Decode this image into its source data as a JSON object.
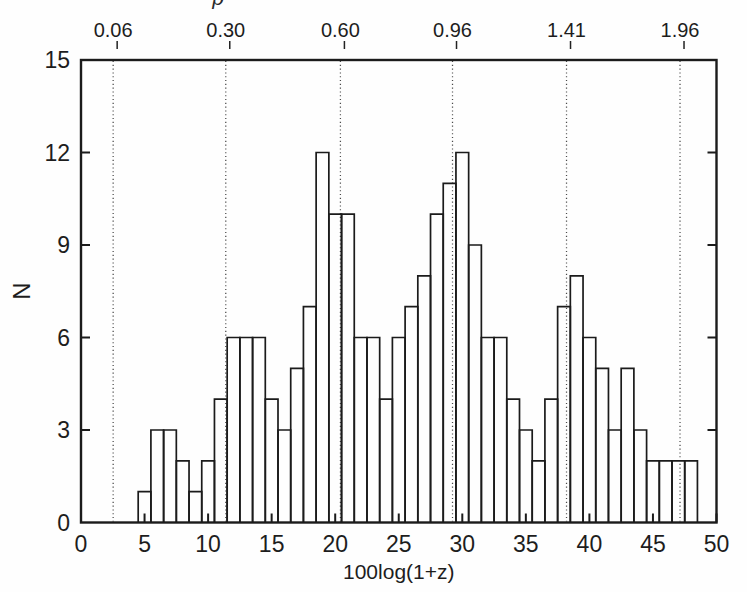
{
  "page": {
    "header_fragment": "p"
  },
  "chart_data": {
    "type": "bar",
    "subtype": "histogram",
    "title": "",
    "xlabel": "100log(1+z)",
    "ylabel": "N",
    "xlim": [
      0,
      50
    ],
    "ylim": [
      0,
      15
    ],
    "x_ticks": [
      0,
      5,
      10,
      15,
      20,
      25,
      30,
      35,
      40,
      45,
      50
    ],
    "y_ticks": [
      0,
      3,
      6,
      9,
      12,
      15
    ],
    "grid": "vertical-dotted-at-top-axis-ticks",
    "legend": "none",
    "bar_fill": "none",
    "line_color": "#1b1b1b",
    "top_axis": {
      "labels": [
        "0.06",
        "0.30",
        "0.60",
        "0.96",
        "1.41",
        "1.96"
      ],
      "positions_x": [
        2.53,
        11.39,
        20.41,
        29.23,
        38.2,
        47.13
      ]
    },
    "bins": {
      "start": 4.5,
      "width": 1,
      "centers": [
        5,
        6,
        7,
        8,
        9,
        10,
        11,
        12,
        13,
        14,
        15,
        16,
        17,
        18,
        19,
        20,
        21,
        22,
        23,
        24,
        25,
        26,
        27,
        28,
        29,
        30,
        31,
        32,
        33,
        34,
        35,
        36,
        37,
        38,
        39,
        40,
        41,
        42,
        43,
        44,
        45,
        46,
        47,
        48
      ],
      "counts": [
        1,
        3,
        3,
        2,
        1,
        2,
        4,
        6,
        6,
        6,
        4,
        3,
        5,
        7,
        12,
        10,
        10,
        6,
        6,
        4,
        6,
        7,
        8,
        10,
        11,
        12,
        9,
        6,
        6,
        4,
        3,
        2,
        4,
        7,
        8,
        6,
        5,
        3,
        5,
        3,
        2,
        2,
        2,
        2
      ]
    }
  }
}
